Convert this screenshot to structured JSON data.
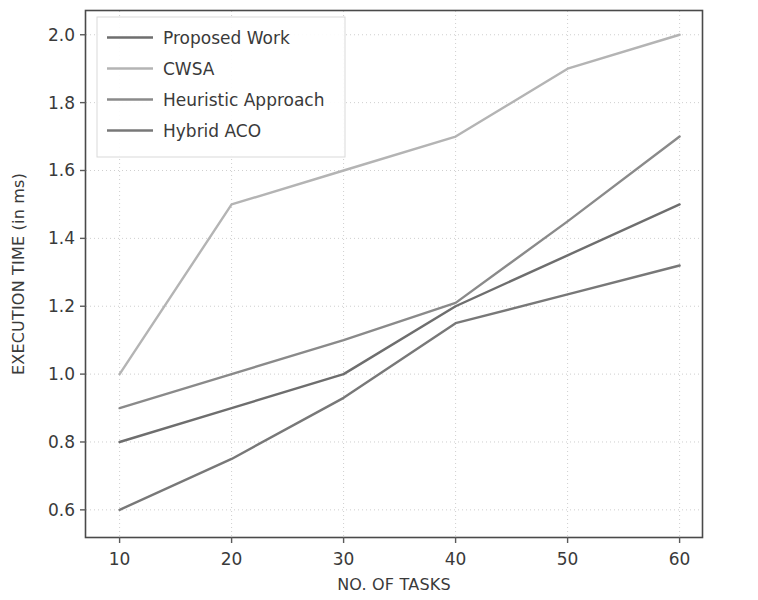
{
  "chart_data": {
    "type": "line",
    "title": "",
    "xlabel": "NO. OF TASKS",
    "ylabel": "EXECUTION TIME (in ms)",
    "x": [
      10,
      20,
      30,
      40,
      50,
      60
    ],
    "xticklabels": [
      "10",
      "20",
      "30",
      "40",
      "50",
      "60"
    ],
    "yticks": [
      0.6,
      0.8,
      1.0,
      1.2,
      1.4,
      1.6,
      1.8,
      2.0
    ],
    "yticklabels": [
      "0.6",
      "0.8",
      "1.0",
      "1.2",
      "1.4",
      "1.6",
      "1.8",
      "2.0"
    ],
    "xlim": [
      7,
      62
    ],
    "ylim": [
      0.52,
      2.07
    ],
    "grid": true,
    "legend_position": "upper left",
    "series": [
      {
        "name": "Proposed Work",
        "values": [
          0.8,
          0.9,
          1.0,
          1.2,
          1.35,
          1.5
        ],
        "color": "#6e6e6e"
      },
      {
        "name": "CWSA",
        "values": [
          1.0,
          1.5,
          1.6,
          1.7,
          1.9,
          2.0
        ],
        "color": "#b4b4b4"
      },
      {
        "name": "Heuristic Approach",
        "values": [
          0.9,
          1.0,
          1.1,
          1.21,
          1.45,
          1.7
        ],
        "color": "#8a8a8a"
      },
      {
        "name": "Hybrid ACO",
        "values": [
          0.6,
          0.75,
          0.93,
          1.15,
          1.235,
          1.32
        ],
        "color": "#787878"
      }
    ]
  },
  "figure": {
    "background_color": "#ffffff",
    "axis_color": "#4a4a4a",
    "grid_color": "#cfcfcf",
    "text_color": "#3a3a3a"
  }
}
